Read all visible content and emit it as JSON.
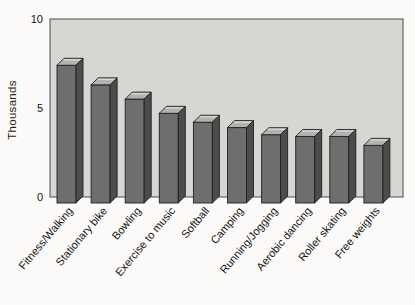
{
  "chart_data": {
    "type": "bar",
    "variant": "3d-column",
    "title": "",
    "xlabel": "",
    "ylabel": "Thousands",
    "categories": [
      "Fitness/Walking",
      "Stationary bike",
      "Bowling",
      "Exercise to music",
      "Softball",
      "Camping",
      "Running/Jogging",
      "Aerobic dancing",
      "Roller skating",
      "Free weights"
    ],
    "values": [
      7.4,
      6.3,
      5.5,
      4.7,
      4.2,
      3.9,
      3.5,
      3.4,
      3.4,
      2.9
    ],
    "yticks": [
      0,
      5,
      10
    ],
    "ylim": [
      0,
      10
    ],
    "grid": false,
    "legend": false,
    "category_label_angle_deg": -50,
    "colors": {
      "page_bg": "#fbfaf8",
      "plot_bg": "#d8d6d2",
      "plot_border": "#4a4a4a",
      "bar_front": "#6e6e6e",
      "bar_top": "#b4b2af",
      "bar_top_highlight": "#dcdbd8",
      "bar_side": "#4c4c4c",
      "bar_outline": "#1f1f1f",
      "axis_text": "#141414"
    }
  }
}
